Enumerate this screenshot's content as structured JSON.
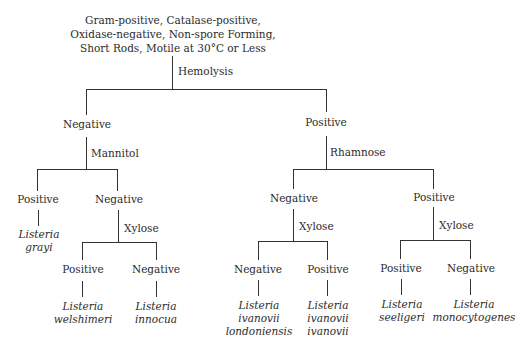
{
  "root": {
    "lines": [
      "Gram-positive, Catalase-positive,",
      "Oxidase-negative, Non-spore Forming,",
      "Short Rods, Motile at 30°C or Less"
    ]
  },
  "tests": {
    "hemolysis": "Hemolysis",
    "mannitol": "Mannitol",
    "rhamnose": "Rhamnose",
    "xylose_left": "Xylose",
    "xylose_mid": "Xylose",
    "xylose_right": "Xylose"
  },
  "nodes": {
    "hemolysis_negative": "Negative",
    "hemolysis_positive": "Positive",
    "mannitol_positive": "Positive",
    "mannitol_negative": "Negative",
    "rhamnose_negative": "Negative",
    "rhamnose_positive": "Positive",
    "xylose1_positive": "Positive",
    "xylose1_negative": "Negative",
    "xylose2_negative": "Negative",
    "xylose2_positive": "Positive",
    "xylose3_positive": "Positive",
    "xylose3_negative": "Negative"
  },
  "species": {
    "grayi": [
      "Listeria",
      "grayi"
    ],
    "welshimeri": [
      "Listeria",
      "welshimeri"
    ],
    "innocua": [
      "Listeria",
      "innocua"
    ],
    "ivanovii_londoniensis": [
      "Listeria",
      "ivanovii",
      "londoniensis"
    ],
    "ivanovii_ivanovii": [
      "Listeria",
      "ivanovii",
      "ivanovii"
    ],
    "seeligeri": [
      "Listeria",
      "seeligeri"
    ],
    "monocytogenes": [
      "Listeria",
      "monocytogenes"
    ]
  }
}
